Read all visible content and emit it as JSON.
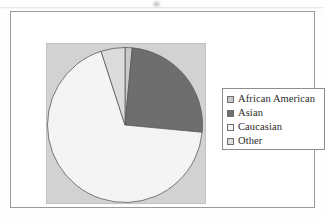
{
  "figure": {
    "background_color": "#fefefe",
    "frame_color": "#9a9a9a",
    "plot_panel_color": "#d2d2d2"
  },
  "legend": {
    "border_color": "#8d8d8d",
    "background_color": "#ffffff",
    "items": [
      {
        "label": "African American",
        "color": "#c9c9c9"
      },
      {
        "label": "Asian",
        "color": "#6e6e6e"
      },
      {
        "label": "Caucasian",
        "color": "#f4f4f4"
      },
      {
        "label": "Other",
        "color": "#dcdcdc"
      }
    ]
  },
  "chart_data": {
    "type": "pie",
    "title": "",
    "categories": [
      "African American",
      "Asian",
      "Caucasian",
      "Other"
    ],
    "values": [
      1.5,
      25.0,
      68.5,
      5.0
    ],
    "unit": "percent",
    "colors": [
      "#c9c9c9",
      "#6e6e6e",
      "#f4f4f4",
      "#dcdcdc"
    ],
    "start_angle_deg": 0,
    "direction": "clockwise",
    "legend_position": "right",
    "grid": false,
    "slice_border_color": "#5a5a5a",
    "labels_shown": false
  }
}
